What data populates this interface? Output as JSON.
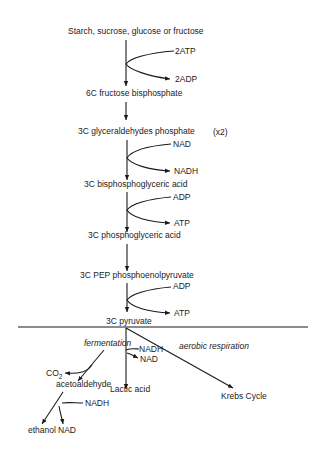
{
  "diagram": {
    "multiplier_note": "(x2)",
    "steps": [
      {
        "label": "Starch, sucrose, glucose or fructose"
      },
      {
        "label": "6C fructose bisphosphate"
      },
      {
        "label": "3C glyceraldehydes phosphate"
      },
      {
        "label": "3C bisphosphoglyceric acid"
      },
      {
        "label": "3C phosphoglyceric acid"
      },
      {
        "label": "3C PEP phosphoenolpyruvate"
      },
      {
        "label": "3C pyruvate"
      }
    ],
    "side_reactions": [
      {
        "in": "2ATP",
        "out": "2ADP"
      },
      {
        "in": "NAD",
        "out": "NADH"
      },
      {
        "in": "ADP",
        "out": "ATP"
      },
      {
        "in": "ADP",
        "out": "ATP"
      }
    ],
    "branches": {
      "fermentation": {
        "label": "fermentation",
        "co2_main": "CO",
        "co2_sub": "2",
        "intermediate": "acetoaldehyde",
        "nadh": "NADH",
        "ethanol": "ethanol",
        "nad": "NAD"
      },
      "lactic": {
        "nadh": "NADH",
        "nad": "NAD",
        "product": "Lactic acid"
      },
      "aerobic": {
        "label": "aerobic respiration",
        "product": "Krebs Cycle"
      }
    }
  }
}
